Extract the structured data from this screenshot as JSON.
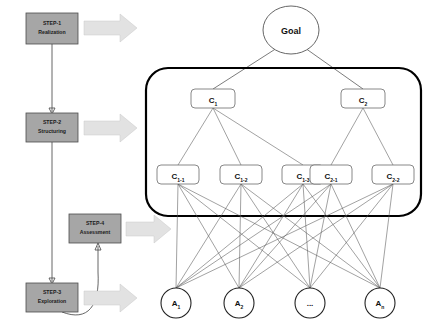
{
  "diagram": {
    "colors": {
      "step_box_fill": "#a6a6a6",
      "step_box_stroke": "#4d4d4d",
      "block_arrow_fill": "#e2e2e2",
      "node_stroke": "#6b6b6b",
      "frame_stroke": "#000000",
      "edge_stroke": "#555555",
      "background": "#ffffff"
    },
    "steps": [
      {
        "id": "step-1",
        "line1": "STEP-1",
        "line2": "Realization"
      },
      {
        "id": "step-2",
        "line1": "STEP-2",
        "line2": "Structuring"
      },
      {
        "id": "step-4",
        "line1": "STEP-4",
        "line2": "Assessment"
      },
      {
        "id": "step-3",
        "line1": "STEP-3",
        "line2": "Exploration"
      }
    ],
    "hierarchy": {
      "goal": {
        "label": "Goal"
      },
      "criteria": [
        {
          "base": "C",
          "sub": "1"
        },
        {
          "base": "C",
          "sub": "2"
        }
      ],
      "subcriteria": [
        {
          "base": "C",
          "sub": "1-1"
        },
        {
          "base": "C",
          "sub": "1-2"
        },
        {
          "base": "C",
          "sub": "1-3"
        },
        {
          "base": "C",
          "sub": "2-1"
        },
        {
          "base": "C",
          "sub": "2-2"
        }
      ],
      "alternatives": [
        {
          "base": "A",
          "sub": "1"
        },
        {
          "base": "A",
          "sub": "2"
        },
        {
          "base": "...",
          "sub": ""
        },
        {
          "base": "A",
          "sub": "n"
        }
      ]
    },
    "arrows": {
      "count": 4,
      "shape": "block-arrow-right"
    }
  }
}
